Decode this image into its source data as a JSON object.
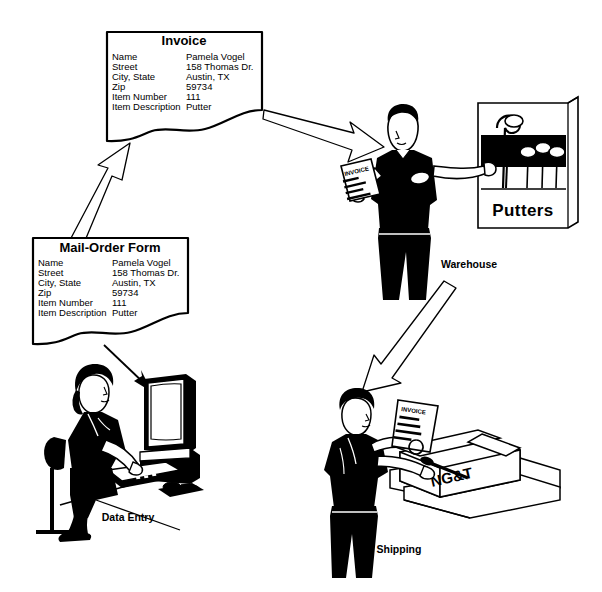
{
  "diagram": {
    "background_color": "#ffffff",
    "ink_color": "#000000"
  },
  "documents": [
    {
      "id": "invoice",
      "title": "Invoice",
      "rows": [
        {
          "label": "Name",
          "value": "Pamela Vogel"
        },
        {
          "label": "Street",
          "value": "158 Thomas Dr."
        },
        {
          "label": "City, State",
          "value": "Austin, TX"
        },
        {
          "label": "Zip",
          "value": "59734"
        },
        {
          "label": "Item Number",
          "value": "111"
        },
        {
          "label": "Item Description",
          "value": "Putter"
        }
      ]
    },
    {
      "id": "mail_order_form",
      "title": "Mail-Order Form",
      "rows": [
        {
          "label": "Name",
          "value": "Pamela Vogel"
        },
        {
          "label": "Street",
          "value": "158 Thomas Dr."
        },
        {
          "label": "City, State",
          "value": "Austin, TX"
        },
        {
          "label": "Zip",
          "value": "59734"
        },
        {
          "label": "Item Number",
          "value": "111"
        },
        {
          "label": "Item Description",
          "value": "Putter"
        }
      ]
    }
  ],
  "scenes": [
    {
      "id": "warehouse",
      "caption": "Warehouse",
      "sign": "Putters",
      "description": "warehouse-worker-with-invoice-at-putter-rack"
    },
    {
      "id": "data_entry",
      "caption": "Data Entry",
      "description": "clerk-typing-order-into-computer"
    },
    {
      "id": "shipping",
      "caption": "Shipping",
      "box_label": "NG&T",
      "description": "shipping-worker-packing-putter-into-box-with-invoice"
    }
  ],
  "held_documents": [
    {
      "id": "warehouse_invoice",
      "heading": "INVOICE"
    },
    {
      "id": "shipping_invoice",
      "heading": "INVOICE",
      "lines": [
        "Name",
        "Street",
        "City, State",
        "Zip"
      ]
    }
  ],
  "arrows": [
    {
      "id": "form-to-invoice",
      "from": "Mail-Order Form",
      "to": "Invoice",
      "style": "outline"
    },
    {
      "id": "invoice-to-warehouse",
      "from": "Invoice",
      "to": "Warehouse",
      "style": "outline"
    },
    {
      "id": "warehouse-to-shipping",
      "from": "Warehouse",
      "to": "Shipping",
      "style": "outline"
    },
    {
      "id": "form-to-data-entry",
      "from": "Mail-Order Form",
      "to": "Data Entry",
      "style": "solid-thin"
    }
  ]
}
